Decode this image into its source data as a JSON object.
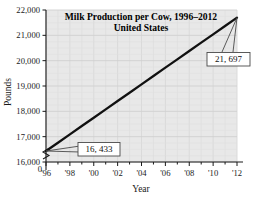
{
  "chart_data": {
    "type": "line",
    "title": "Milk Production per Cow, 1996–2012",
    "subtitle": "United States",
    "xlabel": "Year",
    "ylabel": "Pounds",
    "xlim": [
      1996,
      2012
    ],
    "ylim": [
      16000,
      22000
    ],
    "y_axis_break": true,
    "y_zero_label": "0",
    "grid": true,
    "legend": "none",
    "x_tick_labels": [
      "'96",
      "'98",
      "'00",
      "'02",
      "'04",
      "'06",
      "'08",
      "'10",
      "'12"
    ],
    "x_tick_values": [
      1996,
      1998,
      2000,
      2002,
      2004,
      2006,
      2008,
      2010,
      2012
    ],
    "y_tick_labels": [
      "16,000",
      "17,000",
      "18,000",
      "19,000",
      "20,000",
      "21,000",
      "22,000"
    ],
    "y_tick_values": [
      16000,
      17000,
      18000,
      19000,
      20000,
      21000,
      22000
    ],
    "x": [
      1996,
      1997,
      1998,
      1999,
      2000,
      2001,
      2002,
      2003,
      2004,
      2005,
      2006,
      2007,
      2008,
      2009,
      2010,
      2011,
      2012
    ],
    "values": [
      16433,
      16762,
      17091,
      17420,
      17749,
      18078,
      18407,
      18736,
      19065,
      19394,
      19723,
      20052,
      20381,
      20710,
      21039,
      21368,
      21697
    ],
    "series": [
      {
        "name": "Milk production per cow",
        "values": [
          16433,
          16762,
          17091,
          17420,
          17749,
          18078,
          18407,
          18736,
          19065,
          19394,
          19723,
          20052,
          20381,
          20710,
          21039,
          21368,
          21697
        ]
      }
    ],
    "annotations": [
      {
        "label": "16, 433",
        "x": 1996,
        "y": 16433
      },
      {
        "label": "21, 697",
        "x": 2012,
        "y": 21697
      }
    ],
    "colors": {
      "line": "#111111",
      "plot_background": "#e8e8e8",
      "grid": "#d2d2d2",
      "axis": "#1a1a1a",
      "callout_fill": "#ffffff",
      "callout_border": "#4a4a4a"
    }
  }
}
